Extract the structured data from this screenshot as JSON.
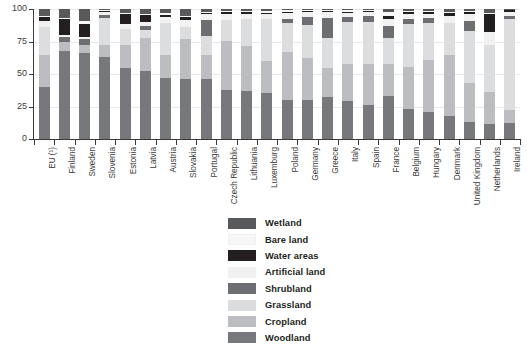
{
  "chart_data": {
    "type": "bar",
    "subtype": "stacked-bar-percentage",
    "title": "",
    "xlabel": "",
    "ylabel": "",
    "ylim": [
      0,
      100
    ],
    "yticks": [
      0,
      25,
      50,
      75,
      100
    ],
    "grid": true,
    "legend_position": "bottom-center",
    "stack_order_bottom_to_top": [
      "Woodland",
      "Cropland",
      "Grassland",
      "Shrubland",
      "Artificial land",
      "Water areas",
      "Bare land",
      "Wetland"
    ],
    "series": [
      {
        "name": "Woodland",
        "color": "#77787b",
        "values": [
          40.0,
          68.0,
          66.5,
          63.0,
          55.0,
          52.5,
          47.0,
          46.5,
          46.0,
          38.0,
          37.0,
          35.5,
          30.0,
          30.0,
          32.5,
          29.5,
          26.0,
          33.0,
          23.0,
          21.0,
          17.5,
          13.0,
          11.5,
          12.5
        ]
      },
      {
        "name": "Cropland",
        "color": "#bcbdc0",
        "values": [
          24.5,
          6.5,
          6.0,
          9.0,
          17.0,
          25.0,
          17.5,
          30.5,
          18.5,
          37.5,
          34.5,
          24.5,
          37.0,
          32.5,
          22.0,
          28.0,
          31.5,
          25.0,
          32.5,
          40.0,
          47.5,
          30.0,
          25.0,
          9.5
        ]
      },
      {
        "name": "Grassland",
        "color": "#dcdddf",
        "values": [
          22.0,
          0.0,
          0.0,
          21.0,
          12.5,
          6.5,
          25.0,
          9.5,
          14.5,
          16.0,
          21.0,
          32.0,
          22.0,
          25.5,
          23.0,
          32.5,
          32.5,
          20.0,
          33.0,
          28.0,
          24.5,
          40.0,
          36.0,
          70.0
        ]
      },
      {
        "name": "Shrubland",
        "color": "#6d6e71",
        "values": [
          0.0,
          4.0,
          4.5,
          2.5,
          0.0,
          3.0,
          0.0,
          0.0,
          12.5,
          0.0,
          0.0,
          0.0,
          3.5,
          5.5,
          15.5,
          4.0,
          4.5,
          9.0,
          3.5,
          4.0,
          0.0,
          7.5,
          0.0,
          2.5
        ]
      },
      {
        "name": "Artificial land",
        "color": "#f1f1f2",
        "values": [
          4.5,
          1.5,
          1.5,
          2.0,
          4.0,
          3.0,
          4.5,
          5.0,
          4.5,
          4.5,
          3.5,
          4.0,
          4.5,
          4.0,
          4.5,
          3.0,
          3.5,
          5.5,
          4.5,
          3.5,
          5.5,
          5.5,
          9.5,
          3.0
        ]
      },
      {
        "name": "Water areas",
        "color": "#231f20",
        "values": [
          2.5,
          12.0,
          10.0,
          0.7,
          7.5,
          5.5,
          1.5,
          2.0,
          0.7,
          1.5,
          1.5,
          1.2,
          1.0,
          1.2,
          1.0,
          1.0,
          0.8,
          2.5,
          1.2,
          1.0,
          2.0,
          1.5,
          14.0,
          1.5
        ]
      },
      {
        "name": "Bare land",
        "color": "#f7f7f7",
        "values": [
          1.5,
          1.0,
          2.5,
          0.8,
          1.0,
          1.0,
          1.5,
          1.5,
          1.3,
          1.0,
          1.0,
          1.0,
          1.0,
          0.8,
          0.8,
          1.0,
          0.7,
          2.5,
          1.0,
          1.0,
          1.0,
          1.0,
          1.0,
          0.5
        ]
      },
      {
        "name": "Wetland",
        "color": "#58595b",
        "values": [
          5.0,
          7.0,
          9.0,
          1.0,
          3.0,
          3.5,
          3.0,
          5.0,
          2.0,
          1.5,
          1.5,
          1.8,
          1.0,
          0.5,
          0.7,
          1.0,
          0.5,
          2.5,
          1.3,
          1.5,
          2.0,
          1.5,
          3.0,
          0.5
        ]
      }
    ],
    "categories": [
      "EU (¹)",
      "Finland",
      "Sweden",
      "Slovenia",
      "Estonia",
      "Latvia",
      "Austria",
      "Slovakia",
      "Portugal",
      "Czech Republic",
      "Lithuania",
      "Luxemburg",
      "Poland",
      "Germany",
      "Greece",
      "Italy",
      "Spain",
      "France",
      "Belgium",
      "Hungary",
      "Denmark",
      "United Kingdom",
      "Netherlands",
      "Ireland"
    ]
  },
  "axis": {
    "y_tick_labels": [
      "100",
      "75",
      "50",
      "25",
      "0"
    ]
  },
  "legend": {
    "items": [
      {
        "label": "Wetland",
        "color": "#58595b"
      },
      {
        "label": "Bare land",
        "color": "#f7f7f7"
      },
      {
        "label": "Water areas",
        "color": "#231f20"
      },
      {
        "label": "Artificial land",
        "color": "#f1f1f2"
      },
      {
        "label": "Shrubland",
        "color": "#6d6e71"
      },
      {
        "label": "Grassland",
        "color": "#dcdddf"
      },
      {
        "label": "Cropland",
        "color": "#bcbdc0"
      },
      {
        "label": "Woodland",
        "color": "#77787b"
      }
    ]
  }
}
